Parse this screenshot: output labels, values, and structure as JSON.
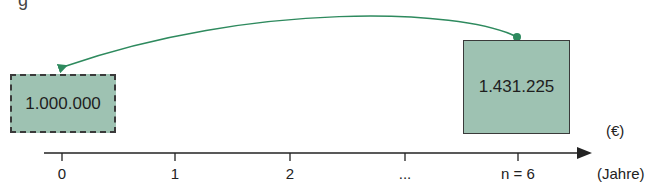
{
  "heading_fragment": "g",
  "present_value": {
    "label": "1.000.000",
    "style": "dashed"
  },
  "future_value": {
    "label": "1.431.225",
    "style": "solid"
  },
  "currency_unit": "(€)",
  "time_unit": "(Jahre)",
  "timeline": {
    "ticks": [
      "0",
      "1",
      "2",
      "...",
      "n = 6"
    ]
  },
  "arrow": {
    "from": "n = 6",
    "to": "0",
    "meaning": "discounting"
  },
  "colors": {
    "box_fill": "#9ec2b2",
    "arrow": "#2e8a5e",
    "axis": "#222222"
  }
}
